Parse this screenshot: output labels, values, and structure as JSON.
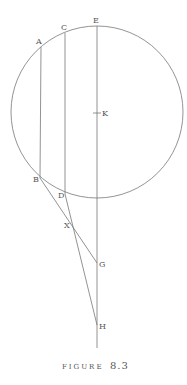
{
  "figure": {
    "caption_word": "FIGURE",
    "caption_number": "8.3",
    "stroke_color": "#777777",
    "label_color": "#555555"
  },
  "circle": {
    "cx": 97,
    "cy": 112,
    "r": 86,
    "center_label": "K"
  },
  "points": {
    "A": {
      "label": "A",
      "x": 41,
      "y": 47
    },
    "C": {
      "label": "C",
      "x": 65,
      "y": 33
    },
    "E": {
      "label": "E",
      "x": 97,
      "y": 26
    },
    "K": {
      "label": "K",
      "x": 97,
      "y": 113
    },
    "B": {
      "label": "B",
      "x": 40,
      "y": 178
    },
    "D": {
      "label": "D",
      "x": 65,
      "y": 194
    },
    "X": {
      "label": "X",
      "x": 72,
      "y": 225
    },
    "G": {
      "label": "G",
      "x": 97,
      "y": 263
    },
    "H": {
      "label": "H",
      "x": 97,
      "y": 325
    }
  },
  "segments": [
    {
      "name": "AB",
      "from": "A",
      "to": "B"
    },
    {
      "name": "CD",
      "from": "C",
      "to": "D"
    },
    {
      "name": "EH-extended",
      "from": "E",
      "to": "end"
    },
    {
      "name": "BG",
      "from": "B",
      "to": "G"
    },
    {
      "name": "DH",
      "from": "D",
      "to": "H"
    }
  ]
}
